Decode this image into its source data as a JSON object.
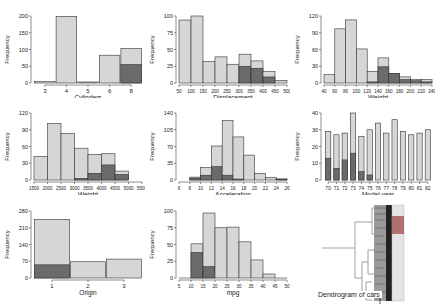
{
  "colors": {
    "light": "#d6d6d6",
    "dark": "#6b6b6b",
    "stroke": "#333333",
    "axis": "#444444"
  },
  "chart_data": [
    {
      "id": "cylinders",
      "type": "bar",
      "xlabel": "Cylinders",
      "ylabel": "Frequency",
      "categories": [
        "3",
        "4",
        "5",
        "6",
        "8"
      ],
      "series": [
        {
          "name": "all",
          "values": [
            4,
            199,
            3,
            83,
            103
          ]
        },
        {
          "name": "highlighted",
          "values": [
            0,
            0,
            0,
            0,
            55
          ]
        }
      ],
      "ylim": [
        0,
        200
      ],
      "yticks": [
        0,
        50,
        100,
        150,
        200
      ]
    },
    {
      "id": "displacement",
      "type": "histogram",
      "xlabel": "Displacement",
      "ylabel": "Frequency",
      "bins": [
        50,
        100,
        150,
        200,
        250,
        300,
        350,
        400,
        450,
        500
      ],
      "series": [
        {
          "name": "all",
          "values": [
            94,
            100,
            32,
            39,
            28,
            43,
            33,
            17,
            4
          ]
        },
        {
          "name": "highlighted",
          "values": [
            0,
            0,
            0,
            0,
            0,
            25,
            22,
            9,
            0
          ]
        }
      ],
      "ylim": [
        0,
        100
      ],
      "yticks": [
        0,
        25,
        50,
        75,
        100
      ],
      "xticks": [
        50,
        100,
        150,
        200,
        250,
        300,
        350,
        400,
        450,
        500
      ]
    },
    {
      "id": "horsepower",
      "type": "histogram",
      "xlabel": "Weight",
      "ylabel": "Frequency",
      "bins": [
        40,
        60,
        80,
        100,
        120,
        140,
        160,
        180,
        200,
        220,
        240
      ],
      "series": [
        {
          "name": "all",
          "values": [
            15,
            97,
            113,
            61,
            21,
            45,
            17,
            11,
            6,
            6
          ]
        },
        {
          "name": "highlighted",
          "values": [
            0,
            0,
            0,
            0,
            2,
            29,
            17,
            6,
            4,
            2
          ]
        }
      ],
      "ylim": [
        0,
        120
      ],
      "yticks": [
        0,
        30,
        60,
        90,
        120
      ],
      "xticks": [
        40,
        60,
        80,
        100,
        120,
        140,
        160,
        180,
        200,
        220,
        240
      ]
    },
    {
      "id": "weight",
      "type": "histogram",
      "xlabel": "Weight",
      "ylabel": "Frequency",
      "bins": [
        1500,
        2000,
        2500,
        3000,
        3500,
        4000,
        4500,
        5000
      ],
      "series": [
        {
          "name": "all",
          "values": [
            42,
            101,
            83,
            57,
            46,
            47,
            16
          ]
        },
        {
          "name": "highlighted",
          "values": [
            0,
            0,
            0,
            3,
            12,
            27,
            10
          ]
        }
      ],
      "ylim": [
        0,
        120
      ],
      "yticks": [
        0,
        30,
        60,
        90,
        120
      ],
      "xticks": [
        1500,
        2000,
        2500,
        3000,
        3500,
        4000,
        4500,
        5000,
        5500
      ]
    },
    {
      "id": "acceleration",
      "type": "histogram",
      "xlabel": "Acceleration",
      "ylabel": "Frequency",
      "bins": [
        8,
        10,
        12,
        14,
        16,
        18,
        20,
        22,
        24,
        26
      ],
      "series": [
        {
          "name": "all",
          "values": [
            6,
            26,
            71,
            124,
            90,
            52,
            14,
            5,
            2
          ]
        },
        {
          "name": "highlighted",
          "values": [
            4,
            10,
            28,
            10,
            2,
            0,
            0,
            0,
            2
          ]
        }
      ],
      "ylim": [
        0,
        140
      ],
      "yticks": [
        0,
        35,
        70,
        105,
        140
      ],
      "xticks": [
        6,
        8,
        10,
        12,
        14,
        16,
        18,
        20,
        22,
        24,
        26
      ]
    },
    {
      "id": "model_year",
      "type": "bar",
      "xlabel": "Model year",
      "ylabel": "Frequency",
      "categories": [
        "70",
        "71",
        "72",
        "73",
        "74",
        "75",
        "76",
        "77",
        "78",
        "79",
        "80",
        "81",
        "82"
      ],
      "series": [
        {
          "name": "all",
          "values": [
            29,
            27,
            28,
            40,
            26,
            30,
            34,
            28,
            36,
            29,
            27,
            28,
            30
          ]
        },
        {
          "name": "highlighted",
          "values": [
            13,
            7,
            12,
            16,
            5,
            3,
            0,
            0,
            0,
            0,
            0,
            0,
            0
          ]
        }
      ],
      "ylim": [
        0,
        40
      ],
      "yticks": [
        0,
        10,
        20,
        30,
        40
      ]
    },
    {
      "id": "origin",
      "type": "bar",
      "xlabel": "Origin",
      "ylabel": "Frequency",
      "categories": [
        "1",
        "2",
        "3"
      ],
      "series": [
        {
          "name": "all",
          "values": [
            245,
            68,
            79
          ]
        },
        {
          "name": "highlighted",
          "values": [
            55,
            0,
            0
          ]
        }
      ],
      "ylim": [
        0,
        280
      ],
      "yticks": [
        0,
        70,
        140,
        210,
        280
      ]
    },
    {
      "id": "mpg",
      "type": "histogram",
      "xlabel": "mpg",
      "ylabel": "Frequency",
      "bins": [
        5,
        10,
        15,
        20,
        25,
        30,
        35,
        40,
        45,
        50
      ],
      "series": [
        {
          "name": "all",
          "values": [
            0,
            51,
            97,
            75,
            76,
            54,
            27,
            6,
            0
          ]
        },
        {
          "name": "highlighted",
          "values": [
            0,
            38,
            17,
            0,
            0,
            0,
            0,
            0,
            0
          ]
        }
      ],
      "ylim": [
        0,
        100
      ],
      "yticks": [
        0,
        25,
        50,
        75,
        100
      ],
      "xticks": [
        5,
        10,
        15,
        20,
        25,
        30,
        35,
        40,
        45,
        50
      ]
    }
  ],
  "dendrogram": {
    "title": "Dendrogram of cars"
  }
}
